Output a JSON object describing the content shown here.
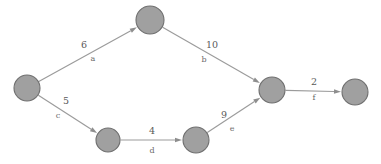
{
  "diagram": {
    "background_color": "#ffffff",
    "node_fill_color": "#a0a0a0",
    "node_stroke_color": "#6f6f6f",
    "edge_color": "#9b9b9b",
    "label_color": "#5a5a5a",
    "nodes": [
      {
        "id": "n1",
        "label": "",
        "cx": 27,
        "cy": 88,
        "r": 13
      },
      {
        "id": "n2",
        "label": "",
        "cx": 150,
        "cy": 20,
        "r": 14
      },
      {
        "id": "n3",
        "label": "",
        "cx": 108,
        "cy": 140,
        "r": 12
      },
      {
        "id": "n4",
        "label": "",
        "cx": 196,
        "cy": 140,
        "r": 13
      },
      {
        "id": "n5",
        "label": "",
        "cx": 272,
        "cy": 90,
        "r": 13
      },
      {
        "id": "n6",
        "label": "",
        "cx": 355,
        "cy": 92,
        "r": 13
      }
    ],
    "edges": [
      {
        "id": "e-a",
        "from": "n1",
        "to": "n2",
        "weight": "6",
        "name": "a",
        "weight_x": 84,
        "weight_y": 45,
        "name_x": 93,
        "name_y": 59
      },
      {
        "id": "e-b",
        "from": "n2",
        "to": "n5",
        "weight": "10",
        "name": "b",
        "weight_x": 212,
        "weight_y": 45,
        "name_x": 204,
        "name_y": 60
      },
      {
        "id": "e-c",
        "from": "n1",
        "to": "n3",
        "weight": "5",
        "name": "c",
        "weight_x": 66,
        "weight_y": 101,
        "name_x": 58,
        "name_y": 116
      },
      {
        "id": "e-d",
        "from": "n3",
        "to": "n4",
        "weight": "4",
        "name": "d",
        "weight_x": 152,
        "weight_y": 131,
        "name_x": 152,
        "name_y": 151
      },
      {
        "id": "e-e",
        "from": "n4",
        "to": "n5",
        "weight": "9",
        "name": "e",
        "weight_x": 224,
        "weight_y": 115,
        "name_x": 232,
        "name_y": 129
      },
      {
        "id": "e-f",
        "from": "n5",
        "to": "n6",
        "weight": "2",
        "name": "f",
        "weight_x": 314,
        "weight_y": 82,
        "name_x": 314,
        "name_y": 98
      }
    ]
  }
}
